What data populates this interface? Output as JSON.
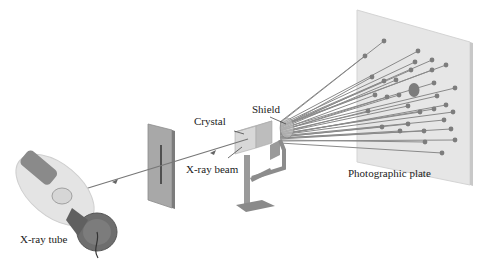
{
  "diagram": {
    "labels": {
      "xray_tube": "X-ray tube",
      "xray_beam": "X-ray beam",
      "crystal": "Crystal",
      "shield": "Shield",
      "photographic_plate": "Photographic plate"
    },
    "colors": {
      "background": "#ffffff",
      "plate": "#e6e6e6",
      "plate_edge": "#c8c8c8",
      "rays": "#8a8a8a",
      "spots": "#7d7d7d",
      "stand": "#9a9a9a",
      "crystal": "#d8d8d8",
      "tube_glass": "#e4e4e4",
      "tube_metal": "#707070",
      "slit_screen": "#a8a8a8",
      "text": "#222222"
    },
    "components": [
      "X-ray tube",
      "Slit screen",
      "X-ray beam",
      "Crystal",
      "Shield",
      "Stand",
      "Diffracted rays",
      "Photographic plate"
    ]
  }
}
